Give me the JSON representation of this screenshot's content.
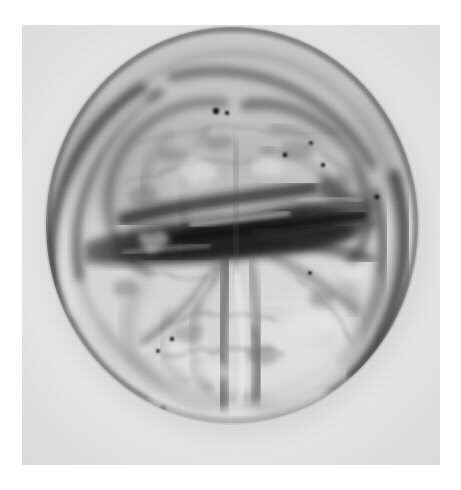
{
  "document": {
    "kind": "photomicrograph-plate",
    "caption": "",
    "background_color": "#ffffff",
    "plate_background_color": "#ececed"
  },
  "plate": {
    "label": "pollen-grain-micrograph",
    "x": 22,
    "y": 25,
    "width": 418,
    "height": 440,
    "modality": "transmitted-light-microscopy",
    "rendering": "grayscale"
  },
  "specimen": {
    "name": "pollen-grain",
    "view": "polar-view",
    "outline_shape": "subcircular",
    "center_x": 210,
    "center_y": 200,
    "radius_x": 185,
    "radius_y": 197,
    "lobe_count": 4,
    "aperture_band": "equatorial-dark-band",
    "tones": {
      "highlight": "#f4f4f4",
      "light": "#dcdcdc",
      "mid": "#a8a8a8",
      "shadow": "#5a5a5a",
      "dark": "#2a2a2a",
      "darkest": "#141414"
    }
  },
  "features": [
    {
      "name": "outer-exine-wall",
      "tone": "#3a3a3a"
    },
    {
      "name": "inner-exine-wall",
      "tone": "#4a4a4a"
    },
    {
      "name": "upper-left-lobe",
      "tone": "#b4b4b4"
    },
    {
      "name": "upper-right-lobe",
      "tone": "#bcbcbc"
    },
    {
      "name": "lower-left-lobe",
      "tone": "#cfcfcf"
    },
    {
      "name": "lower-right-lobe",
      "tone": "#d4d4d4"
    },
    {
      "name": "central-aperture-band",
      "tone": "#1c1c1c"
    },
    {
      "name": "vertical-furrow",
      "tone": "#545454"
    },
    {
      "name": "debris-specks",
      "tone": "#202020"
    }
  ]
}
